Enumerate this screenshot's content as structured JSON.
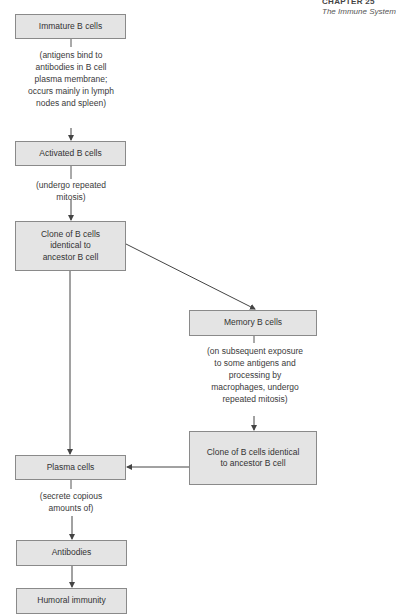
{
  "header": {
    "chapter": "CHAPTER 25",
    "subtitle": "The Immune System"
  },
  "nodes": {
    "immature": "Immature B cells",
    "activated": "Activated B cells",
    "clone_ancestor": "Clone of B cells identical to ancestor B cell",
    "memory": "Memory B cells",
    "clone_memory": "Clone of B cells identical to ancestor B cell",
    "plasma": "Plasma cells",
    "antibodies": "Antibodies",
    "humoral": "Humoral immunity"
  },
  "edges": {
    "immature_to_activated": "(antigens bind to antibodies in B cell plasma membrane; occurs mainly in lymph nodes and spleen)",
    "activated_to_clone": "(undergo repeated mitosis)",
    "memory_to_clone": "(on subsequent exposure to some antigens and processing by macrophages, undergo repeated mitosis)",
    "plasma_to_antibodies": "(secrete copious amounts of)"
  },
  "colors": {
    "box_fill": "#e4e4e4",
    "box_border": "#8a8a8a",
    "line": "#444444"
  }
}
